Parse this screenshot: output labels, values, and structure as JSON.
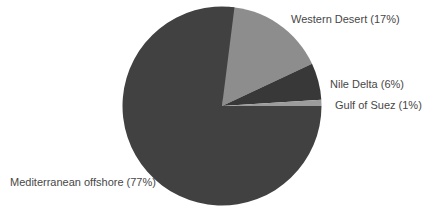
{
  "chart_data": {
    "type": "pie",
    "title": "",
    "legend_position": "none",
    "labels_position": "outside",
    "direction": "clockwise",
    "start_angle_deg": 3.6,
    "slices": [
      {
        "label": "Western Desert",
        "value_pct": 17,
        "label_full": "Western Desert (17%)",
        "color": "#8d8d8d"
      },
      {
        "label": "Nile Delta",
        "value_pct": 6,
        "label_full": "Nile Delta (6%)",
        "color": "#383838"
      },
      {
        "label": "Gulf of Suez",
        "value_pct": 1,
        "label_full": "Gulf of Suez (1%)",
        "color": "#9c9c9c"
      },
      {
        "label": "Mediterranean offshore",
        "value_pct": 77,
        "label_full": "Mediterranean offshore (77%)",
        "color": "#414141"
      }
    ],
    "geometry": {
      "cx": 222,
      "cy": 106,
      "r": 99.5
    }
  },
  "canvas": {
    "background": "#ffffff",
    "label_text_color": "#474747"
  }
}
